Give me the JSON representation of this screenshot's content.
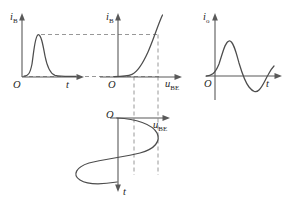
{
  "figure": {
    "background_color": "#ffffff",
    "curve_color": "#4d4d4d",
    "axis_color": "#595959",
    "dash_color": "#8c8c8c",
    "panels": [
      {
        "id": "panel-base-current-waveform",
        "name": "base-current-vs-time",
        "y_axis_label": "i",
        "y_axis_sub": "B",
        "x_axis_label": "t",
        "x_axis_sub": "",
        "origin_label": "O",
        "curve_type": "pulse-waveform",
        "description": "Narrow positive pulse of base current versus time"
      },
      {
        "id": "panel-input-characteristic",
        "name": "input-characteristic-curve",
        "y_axis_label": "i",
        "y_axis_sub": "B",
        "x_axis_label": "u",
        "x_axis_sub": "BE",
        "origin_label": "O",
        "curve_type": "exponential-diode",
        "description": "Base current versus base-emitter voltage, exponential turn-on"
      },
      {
        "id": "panel-output-current-waveform",
        "name": "output-current-vs-time",
        "y_axis_label": "i",
        "y_axis_sub": "o",
        "x_axis_label": "t",
        "x_axis_sub": "",
        "origin_label": "O",
        "curve_type": "bipolar-waveform",
        "description": "Output current versus time, positive peak then negative peak"
      },
      {
        "id": "panel-input-voltage-waveform",
        "name": "input-voltage-vs-time",
        "y_axis_label": "t",
        "y_axis_sub": "",
        "x_axis_label": "u",
        "x_axis_sub": "BE",
        "origin_label": "O",
        "curve_type": "sinusoid-vertical-time",
        "description": "Sinusoidal base-emitter voltage plotted with time running downward"
      }
    ],
    "construction_lines": [
      {
        "name": "peak-projection-horizontal",
        "orientation": "horizontal",
        "style": "dashed"
      },
      {
        "name": "baseline-projection-horizontal",
        "orientation": "horizontal",
        "style": "dashed"
      },
      {
        "name": "quiescent-projection-vertical",
        "orientation": "vertical",
        "style": "dashed"
      },
      {
        "name": "peak-projection-vertical",
        "orientation": "vertical",
        "style": "dashed"
      }
    ]
  }
}
